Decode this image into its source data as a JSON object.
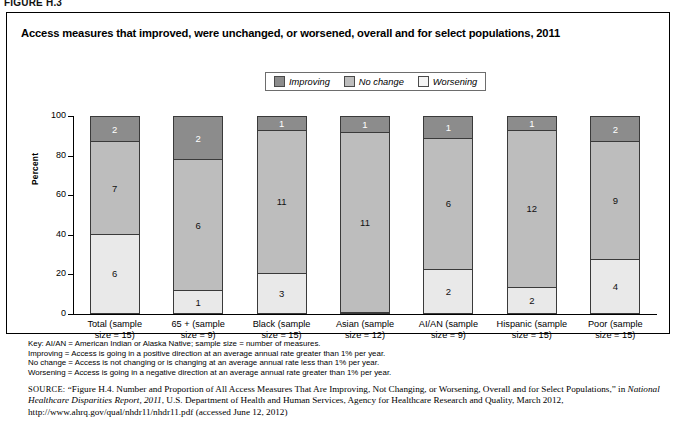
{
  "figure_label": "FIGURE H.3",
  "chart_title": "Access measures that improved, were unchanged, or worsened, overall and for select populations, 2011",
  "legend": {
    "items": [
      {
        "label": "Improving",
        "color": "#8c8c8c",
        "icon": "legend-swatch-improving"
      },
      {
        "label": "No change",
        "color": "#bdbdbd",
        "icon": "legend-swatch-no-change"
      },
      {
        "label": "Worsening",
        "color": "#e9e9e9",
        "icon": "legend-swatch-worsening"
      }
    ]
  },
  "chart_data": {
    "type": "bar",
    "subtype": "stacked-100-percent",
    "title": "Access measures that improved, were unchanged, or worsened, overall and for select populations, 2011",
    "xlabel": "",
    "ylabel": "Percent",
    "ylim": [
      0,
      100
    ],
    "yticks": [
      0,
      20,
      40,
      60,
      80,
      100
    ],
    "grid": false,
    "legend_position": "top-center",
    "categories": [
      "Total (sample size = 15)",
      "65 + (sample size = 9)",
      "Black (sample size = 15)",
      "Asian (sample size = 12)",
      "AI/AN (sample size = 9)",
      "Hispanic (sample size = 15)",
      "Poor (sample size = 15)"
    ],
    "category_lines": [
      [
        "Total (sample",
        "size = 15)"
      ],
      [
        "65 + (sample",
        "size = 9)"
      ],
      [
        "Black (sample",
        "size = 15)"
      ],
      [
        "Asian (sample",
        "size = 12)"
      ],
      [
        "AI/AN (sample",
        "size = 9)"
      ],
      [
        "Hispanic (sample",
        "size = 15)"
      ],
      [
        "Poor (sample",
        "size = 15)"
      ]
    ],
    "sample_sizes": [
      15,
      9,
      15,
      12,
      9,
      15,
      15
    ],
    "series": [
      {
        "name": "Improving",
        "color": "#8c8c8c",
        "values": [
          2,
          2,
          1,
          1,
          1,
          1,
          2
        ],
        "percents": [
          13,
          22,
          7,
          8,
          11,
          7,
          13
        ]
      },
      {
        "name": "No change",
        "color": "#bdbdbd",
        "values": [
          7,
          6,
          11,
          11,
          6,
          12,
          9
        ],
        "percents": [
          47,
          67,
          73,
          92,
          67,
          80,
          60
        ]
      },
      {
        "name": "Worsening",
        "color": "#e9e9e9",
        "values": [
          6,
          1,
          3,
          0,
          2,
          2,
          4
        ],
        "percents": [
          40,
          11,
          20,
          0,
          22,
          13,
          27
        ]
      }
    ]
  },
  "notes": [
    "Key: AI/AN = American Indian or Alaska Native; sample size = number of measures.",
    "Improving = Access is going in a positive direction at an average annual rate greater than 1% per year.",
    "No change = Access is not changing or is changing at an average annual rate less than 1% per year.",
    "Worsening = Access is going in a negative direction at an average annual rate greater than 1% per year."
  ],
  "source": {
    "prefix": "SOURCE:",
    "part1": " “Figure H.4. Number and Proportion of All Access Measures That Are Improving, Not Changing, or Worsening, Overall and for Select Populations,” in ",
    "italic": "National Healthcare Disparities Report, 2011",
    "part2": ", U.S. Department of Health and Human Services, Agency for Healthcare Research and Quality, March 2012, http://www.ahrq.gov/qual/nhdr11/nhdr11.pdf (accessed June 12, 2012)"
  }
}
